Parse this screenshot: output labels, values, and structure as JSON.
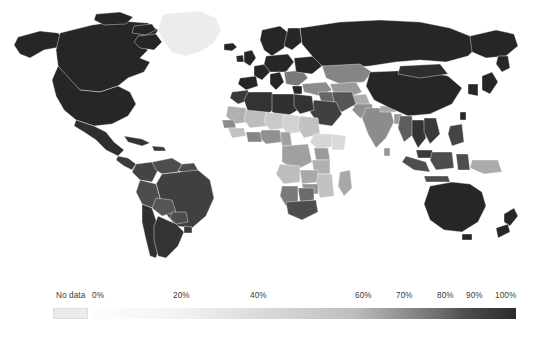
{
  "figure": {
    "type": "choropleth-world-map",
    "background_color": "#ffffff",
    "border_color": "#ffffff"
  },
  "legend": {
    "orientation": "horizontal",
    "no_data_label": "No data",
    "no_data_color": "#ececed",
    "ticks": [
      {
        "label": "0%",
        "value": 0,
        "x": 92,
        "align": "left"
      },
      {
        "label": "20%",
        "value": 20,
        "x": 173,
        "align": "left"
      },
      {
        "label": "40%",
        "value": 40,
        "x": 250,
        "align": "left"
      },
      {
        "label": "60%",
        "value": 60,
        "x": 355,
        "align": "left"
      },
      {
        "label": "70%",
        "value": 70,
        "x": 396,
        "align": "left"
      },
      {
        "label": "80%",
        "value": 80,
        "x": 437,
        "align": "left"
      },
      {
        "label": "90%",
        "value": 90,
        "x": 466,
        "align": "left"
      },
      {
        "label": "100%",
        "value": 100,
        "x": 495,
        "align": "left"
      }
    ],
    "bar": {
      "x": 92,
      "y": 36,
      "width": 424,
      "height": 11
    },
    "stops": [
      {
        "value": 0,
        "color": "#fdfdfd"
      },
      {
        "value": 20,
        "color": "#f4f4f4"
      },
      {
        "value": 40,
        "color": "#dedede"
      },
      {
        "value": 60,
        "color": "#bdbdbd"
      },
      {
        "value": 70,
        "color": "#969696"
      },
      {
        "value": 80,
        "color": "#6f6f6f"
      },
      {
        "value": 90,
        "color": "#4d4d4d"
      },
      {
        "value": 100,
        "color": "#2b2b2b"
      }
    ]
  },
  "chart_data": {
    "type": "heatmap",
    "subtype": "choropleth",
    "title": "",
    "xlabel": "",
    "ylabel": "",
    "projection": "equirectangular-world",
    "value_unit": "%",
    "value_range": [
      0,
      100
    ],
    "legend_scale_breaks": [
      0,
      20,
      40,
      60,
      70,
      80,
      90,
      100
    ],
    "no_data_color": "#ececed",
    "color_scale": [
      "#fdfdfd",
      "#f4f4f4",
      "#dedede",
      "#bdbdbd",
      "#969696",
      "#6f6f6f",
      "#4d4d4d",
      "#2b2b2b"
    ],
    "grid": false,
    "legend_position": "bottom",
    "regions": [
      {
        "name": "Canada",
        "value": 100,
        "color": "#262626"
      },
      {
        "name": "United States",
        "value": 100,
        "color": "#262626"
      },
      {
        "name": "Alaska",
        "value": 100,
        "color": "#262626"
      },
      {
        "name": "Mexico",
        "value": 98,
        "color": "#2e2e2e"
      },
      {
        "name": "Greenland",
        "value": null,
        "color": "#ececed"
      },
      {
        "name": "Cuba",
        "value": 96,
        "color": "#333333"
      },
      {
        "name": "Central America",
        "value": 95,
        "color": "#3a3a3a"
      },
      {
        "name": "Colombia",
        "value": 92,
        "color": "#444444"
      },
      {
        "name": "Venezuela",
        "value": 90,
        "color": "#4d4d4d"
      },
      {
        "name": "Brazil",
        "value": 93,
        "color": "#404040"
      },
      {
        "name": "Peru",
        "value": 90,
        "color": "#4d4d4d"
      },
      {
        "name": "Bolivia",
        "value": 88,
        "color": "#565656"
      },
      {
        "name": "Chile",
        "value": 97,
        "color": "#303030"
      },
      {
        "name": "Argentina",
        "value": 96,
        "color": "#333333"
      },
      {
        "name": "Iceland",
        "value": 100,
        "color": "#262626"
      },
      {
        "name": "United Kingdom",
        "value": 100,
        "color": "#262626"
      },
      {
        "name": "Scandinavia",
        "value": 100,
        "color": "#262626"
      },
      {
        "name": "Western Europe",
        "value": 100,
        "color": "#262626"
      },
      {
        "name": "Balkans",
        "value": 78,
        "color": "#7a7a7a"
      },
      {
        "name": "Turkey",
        "value": 74,
        "color": "#8c8c8c"
      },
      {
        "name": "Russia",
        "value": 100,
        "color": "#262626"
      },
      {
        "name": "Kazakhstan",
        "value": 76,
        "color": "#858585"
      },
      {
        "name": "Central Asia",
        "value": 70,
        "color": "#9a9a9a"
      },
      {
        "name": "Morocco",
        "value": 95,
        "color": "#3a3a3a"
      },
      {
        "name": "Algeria",
        "value": 96,
        "color": "#333333"
      },
      {
        "name": "Libya",
        "value": 97,
        "color": "#303030"
      },
      {
        "name": "Egypt",
        "value": 96,
        "color": "#333333"
      },
      {
        "name": "Mauritania",
        "value": 62,
        "color": "#b0b0b0"
      },
      {
        "name": "Mali",
        "value": 60,
        "color": "#bdbdbd"
      },
      {
        "name": "Niger",
        "value": 55,
        "color": "#c9c9c9"
      },
      {
        "name": "Chad",
        "value": 52,
        "color": "#d2d2d2"
      },
      {
        "name": "Sudan",
        "value": 58,
        "color": "#c2c2c2"
      },
      {
        "name": "Ethiopia",
        "value": 50,
        "color": "#d6d6d6"
      },
      {
        "name": "Somalia",
        "value": 48,
        "color": "#dadada"
      },
      {
        "name": "Nigeria",
        "value": 72,
        "color": "#919191"
      },
      {
        "name": "Ghana",
        "value": 76,
        "color": "#858585"
      },
      {
        "name": "Senegal",
        "value": 74,
        "color": "#8c8c8c"
      },
      {
        "name": "Guinea",
        "value": 58,
        "color": "#c2c2c2"
      },
      {
        "name": "DR Congo",
        "value": 68,
        "color": "#a0a0a0"
      },
      {
        "name": "Kenya",
        "value": 70,
        "color": "#9a9a9a"
      },
      {
        "name": "Tanzania",
        "value": 62,
        "color": "#b0b0b0"
      },
      {
        "name": "Angola",
        "value": 60,
        "color": "#bdbdbd"
      },
      {
        "name": "Zambia",
        "value": 66,
        "color": "#a8a8a8"
      },
      {
        "name": "Mozambique",
        "value": 58,
        "color": "#c2c2c2"
      },
      {
        "name": "Zimbabwe",
        "value": 72,
        "color": "#919191"
      },
      {
        "name": "Namibia",
        "value": 78,
        "color": "#7a7a7a"
      },
      {
        "name": "Botswana",
        "value": 82,
        "color": "#6b6b6b"
      },
      {
        "name": "South Africa",
        "value": 90,
        "color": "#4d4d4d"
      },
      {
        "name": "Madagascar",
        "value": 66,
        "color": "#a8a8a8"
      },
      {
        "name": "Saudi Arabia",
        "value": 93,
        "color": "#404040"
      },
      {
        "name": "Iran",
        "value": 88,
        "color": "#565656"
      },
      {
        "name": "Iraq",
        "value": 84,
        "color": "#666666"
      },
      {
        "name": "Afghanistan",
        "value": 64,
        "color": "#ababab"
      },
      {
        "name": "Pakistan",
        "value": 72,
        "color": "#919191"
      },
      {
        "name": "India",
        "value": 74,
        "color": "#8c8c8c"
      },
      {
        "name": "Nepal",
        "value": 66,
        "color": "#a8a8a8"
      },
      {
        "name": "Bangladesh",
        "value": 70,
        "color": "#9a9a9a"
      },
      {
        "name": "China",
        "value": 100,
        "color": "#262626"
      },
      {
        "name": "Mongolia",
        "value": 98,
        "color": "#2e2e2e"
      },
      {
        "name": "Japan",
        "value": 100,
        "color": "#262626"
      },
      {
        "name": "Korea",
        "value": 100,
        "color": "#262626"
      },
      {
        "name": "Myanmar",
        "value": 86,
        "color": "#5e5e5e"
      },
      {
        "name": "Thailand",
        "value": 96,
        "color": "#333333"
      },
      {
        "name": "Vietnam",
        "value": 95,
        "color": "#3a3a3a"
      },
      {
        "name": "Philippines",
        "value": 92,
        "color": "#444444"
      },
      {
        "name": "Malaysia",
        "value": 95,
        "color": "#3a3a3a"
      },
      {
        "name": "Indonesia",
        "value": 90,
        "color": "#4d4d4d"
      },
      {
        "name": "Papua New Guinea",
        "value": 64,
        "color": "#ababab"
      },
      {
        "name": "Australia",
        "value": 100,
        "color": "#262626"
      },
      {
        "name": "New Zealand",
        "value": 100,
        "color": "#262626"
      }
    ]
  }
}
